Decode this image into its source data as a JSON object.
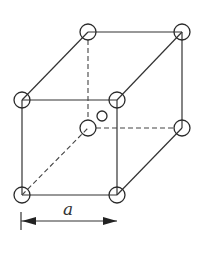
{
  "diagram": {
    "type": "unit-cell",
    "colors": {
      "line": "#333333",
      "background": "#ffffff"
    },
    "vertices": {
      "back_top_left": [
        88,
        32
      ],
      "back_top_right": [
        182,
        32
      ],
      "front_top_left": [
        22,
        100
      ],
      "front_top_right": [
        117,
        100
      ],
      "back_bottom_left": [
        88,
        128
      ],
      "back_bottom_right": [
        182,
        128
      ],
      "front_bottom_left": [
        22,
        195
      ],
      "front_bottom_right": [
        117,
        195
      ]
    },
    "corner_atom_radius": 8,
    "center_atom": {
      "position": [
        102,
        116
      ],
      "radius": 5
    },
    "dimension": {
      "label": "a",
      "from_x": 22,
      "to_x": 117,
      "y": 221
    }
  }
}
